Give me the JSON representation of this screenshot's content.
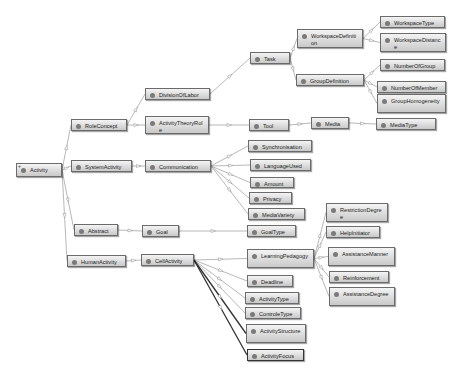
{
  "diagram": {
    "type": "ontology-graph",
    "root": "Activity",
    "nodes": [
      {
        "id": "activity",
        "label": "Activity",
        "x": 16,
        "y": 163,
        "w": 46,
        "h": 14,
        "root": true
      },
      {
        "id": "roleconcept",
        "label": "RoleConcept",
        "x": 71,
        "y": 119,
        "w": 56,
        "h": 12
      },
      {
        "id": "systemactivity",
        "label": "SystemActivity",
        "x": 71,
        "y": 160,
        "w": 61,
        "h": 12
      },
      {
        "id": "abstract",
        "label": "Abstract",
        "x": 74,
        "y": 224,
        "w": 44,
        "h": 12
      },
      {
        "id": "humanactivity",
        "label": "HumanActivity",
        "x": 67,
        "y": 255,
        "w": 59,
        "h": 12
      },
      {
        "id": "divisionoflabor",
        "label": "DivisionOfLabor",
        "x": 145,
        "y": 88,
        "w": 65,
        "h": 12
      },
      {
        "id": "activitytheoryrole",
        "label": "ActivityTheoryRole",
        "x": 145,
        "y": 116,
        "w": 64,
        "h": 18
      },
      {
        "id": "communication",
        "label": "Communication",
        "x": 145,
        "y": 160,
        "w": 66,
        "h": 12
      },
      {
        "id": "goal",
        "label": "Goal",
        "x": 142,
        "y": 225,
        "w": 37,
        "h": 12
      },
      {
        "id": "cellactivity",
        "label": "CellActivity",
        "x": 141,
        "y": 254,
        "w": 53,
        "h": 12
      },
      {
        "id": "task",
        "label": "Task",
        "x": 250,
        "y": 52,
        "w": 40,
        "h": 12
      },
      {
        "id": "tool",
        "label": "Tool",
        "x": 249,
        "y": 119,
        "w": 40,
        "h": 12
      },
      {
        "id": "workspacedefinition",
        "label": "WorkspaceDefinition",
        "x": 297,
        "y": 29,
        "w": 66,
        "h": 19
      },
      {
        "id": "groupdefinition",
        "label": "GroupDefinition",
        "x": 296,
        "y": 74,
        "w": 68,
        "h": 12
      },
      {
        "id": "media",
        "label": "Media",
        "x": 311,
        "y": 117,
        "w": 38,
        "h": 12
      },
      {
        "id": "workspacetype",
        "label": "WorkspaceType",
        "x": 380,
        "y": 16,
        "w": 65,
        "h": 12
      },
      {
        "id": "workspacedistance",
        "label": "WorkspaceDistance",
        "x": 380,
        "y": 33,
        "w": 66,
        "h": 19
      },
      {
        "id": "numberofgroup",
        "label": "NumberOfGroup",
        "x": 380,
        "y": 59,
        "w": 65,
        "h": 12
      },
      {
        "id": "numberofmember",
        "label": "NumberOfMember",
        "x": 377,
        "y": 81,
        "w": 69,
        "h": 12
      },
      {
        "id": "grouphomogeneity",
        "label": "GroupHomogeneity",
        "x": 377,
        "y": 94,
        "w": 69,
        "h": 19
      },
      {
        "id": "mediatype",
        "label": "MediaType",
        "x": 376,
        "y": 118,
        "w": 60,
        "h": 12
      },
      {
        "id": "synchronisation",
        "label": "Synchronisation",
        "x": 248,
        "y": 140,
        "w": 64,
        "h": 12
      },
      {
        "id": "languageused",
        "label": "LanguageUsed",
        "x": 250,
        "y": 159,
        "w": 61,
        "h": 12
      },
      {
        "id": "amount",
        "label": "Amount",
        "x": 250,
        "y": 177,
        "w": 44,
        "h": 11
      },
      {
        "id": "privacy",
        "label": "Privacy",
        "x": 249,
        "y": 192,
        "w": 43,
        "h": 12
      },
      {
        "id": "mediavariety",
        "label": "MediaVariety",
        "x": 248,
        "y": 208,
        "w": 57,
        "h": 12
      },
      {
        "id": "goaltype",
        "label": "GoalType",
        "x": 247,
        "y": 225,
        "w": 49,
        "h": 12
      },
      {
        "id": "learningpedagogy",
        "label": "LearningPedagogy",
        "x": 247,
        "y": 249,
        "w": 67,
        "h": 19
      },
      {
        "id": "deadline",
        "label": "Deadline",
        "x": 247,
        "y": 275,
        "w": 46,
        "h": 12
      },
      {
        "id": "activitytype",
        "label": "ActivityType",
        "x": 245,
        "y": 292,
        "w": 54,
        "h": 12
      },
      {
        "id": "controletype",
        "label": "ControleType",
        "x": 245,
        "y": 307,
        "w": 56,
        "h": 12
      },
      {
        "id": "activitystructure",
        "label": "ActivityStructure",
        "x": 246,
        "y": 324,
        "w": 60,
        "h": 19
      },
      {
        "id": "activityfocus",
        "label": "ActivityFocus",
        "x": 247,
        "y": 349,
        "w": 57,
        "h": 12,
        "focus": true
      },
      {
        "id": "restrictiondegree",
        "label": "RestrictionDegree",
        "x": 326,
        "y": 203,
        "w": 62,
        "h": 19
      },
      {
        "id": "helpinitiator",
        "label": "HelpInitiator",
        "x": 326,
        "y": 226,
        "w": 54,
        "h": 12
      },
      {
        "id": "assistancemanner",
        "label": "AssistanceManner",
        "x": 328,
        "y": 247,
        "w": 67,
        "h": 19
      },
      {
        "id": "reinforcement",
        "label": "Reinforcement",
        "x": 329,
        "y": 271,
        "w": 60,
        "h": 12
      },
      {
        "id": "assistancedegree",
        "label": "AssistanceDegree",
        "x": 329,
        "y": 287,
        "w": 66,
        "h": 19
      }
    ],
    "edges": [
      [
        "activity",
        "roleconcept"
      ],
      [
        "activity",
        "systemactivity"
      ],
      [
        "activity",
        "abstract"
      ],
      [
        "activity",
        "humanactivity"
      ],
      [
        "roleconcept",
        "divisionoflabor"
      ],
      [
        "roleconcept",
        "activitytheoryrole"
      ],
      [
        "systemactivity",
        "communication"
      ],
      [
        "abstract",
        "goal"
      ],
      [
        "humanactivity",
        "cellactivity"
      ],
      [
        "divisionoflabor",
        "task"
      ],
      [
        "activitytheoryrole",
        "tool"
      ],
      [
        "task",
        "workspacedefinition"
      ],
      [
        "task",
        "groupdefinition"
      ],
      [
        "tool",
        "media"
      ],
      [
        "workspacedefinition",
        "workspacetype"
      ],
      [
        "workspacedefinition",
        "workspacedistance"
      ],
      [
        "groupdefinition",
        "numberofgroup"
      ],
      [
        "groupdefinition",
        "numberofmember"
      ],
      [
        "groupdefinition",
        "grouphomogeneity"
      ],
      [
        "media",
        "mediatype"
      ],
      [
        "communication",
        "synchronisation"
      ],
      [
        "communication",
        "languageused"
      ],
      [
        "communication",
        "amount"
      ],
      [
        "communication",
        "privacy"
      ],
      [
        "communication",
        "mediavariety"
      ],
      [
        "goal",
        "goaltype"
      ],
      [
        "cellactivity",
        "learningpedagogy"
      ],
      [
        "cellactivity",
        "deadline"
      ],
      [
        "cellactivity",
        "activitytype"
      ],
      [
        "cellactivity",
        "controletype"
      ],
      [
        "cellactivity",
        "activitystructure"
      ],
      [
        "cellactivity",
        "activityfocus"
      ],
      [
        "learningpedagogy",
        "restrictiondegree"
      ],
      [
        "learningpedagogy",
        "helpinitiator"
      ],
      [
        "learningpedagogy",
        "assistancemanner"
      ],
      [
        "learningpedagogy",
        "reinforcement"
      ],
      [
        "learningpedagogy",
        "assistancedegree"
      ]
    ],
    "colors": {
      "edge": "#9a9a9a",
      "edge_focus": "#333333",
      "node_border": "#6b6b6b",
      "dot": "#7a7a7a"
    }
  }
}
